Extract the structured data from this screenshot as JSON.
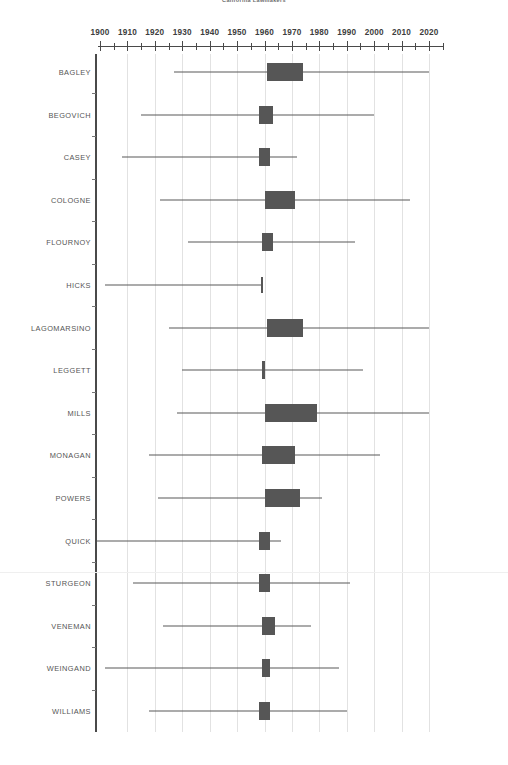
{
  "chart_title": "California Lawmakers",
  "axis": {
    "label": "",
    "tick_labels": [
      "1900",
      "1910",
      "1920",
      "1930",
      "1940",
      "1950",
      "1960",
      "1970",
      "1980",
      "1990",
      "2000",
      "2010",
      "2020"
    ],
    "minor_tick_step": 5,
    "range": [
      1900,
      2025
    ]
  },
  "chart_data": {
    "type": "table",
    "title": "California Lawmakers",
    "xlabel": "Year",
    "ylabel": "",
    "xlim": [
      1900,
      2025
    ],
    "grid": true,
    "legend": "none",
    "categories": [
      "BAGLEY",
      "BEGOVICH",
      "CASEY",
      "COLOGNE",
      "FLOURNOY",
      "HICKS",
      "LAGOMARSINO",
      "LEGGETT",
      "MILLS",
      "MONAGAN",
      "POWERS",
      "QUICK",
      "STURGEON",
      "VENEMAN",
      "WEINGAND",
      "WILLIAMS"
    ],
    "series": [
      {
        "name": "whisker_low",
        "values": [
          1927,
          1915,
          1908,
          1922,
          1932,
          1902,
          1925,
          1930,
          1928,
          1918,
          1921,
          1899,
          1912,
          1923,
          1902,
          1918
        ]
      },
      {
        "name": "box_low",
        "values": [
          1961,
          1958,
          1958,
          1960,
          1959,
          1959,
          1961,
          1959,
          1960,
          1959,
          1960,
          1958,
          1958,
          1959,
          1959,
          1958
        ]
      },
      {
        "name": "box_high",
        "values": [
          1974,
          1963,
          1962,
          1971,
          1963,
          1959,
          1974,
          1960,
          1979,
          1971,
          1973,
          1962,
          1962,
          1964,
          1962,
          1962
        ]
      },
      {
        "name": "whisker_high",
        "values": [
          2020,
          2000,
          1972,
          2013,
          1993,
          1959,
          2020,
          1996,
          2020,
          2002,
          1981,
          1966,
          1991,
          1977,
          1987,
          1990
        ]
      }
    ],
    "rows": [
      {
        "name": "BAGLEY",
        "whisker_low": 1927,
        "box_low": 1961,
        "box_high": 1974,
        "whisker_high": 2020
      },
      {
        "name": "BEGOVICH",
        "whisker_low": 1915,
        "box_low": 1958,
        "box_high": 1963,
        "whisker_high": 2000
      },
      {
        "name": "CASEY",
        "whisker_low": 1908,
        "box_low": 1958,
        "box_high": 1962,
        "whisker_high": 1972
      },
      {
        "name": "COLOGNE",
        "whisker_low": 1922,
        "box_low": 1960,
        "box_high": 1971,
        "whisker_high": 2013
      },
      {
        "name": "FLOURNOY",
        "whisker_low": 1932,
        "box_low": 1959,
        "box_high": 1963,
        "whisker_high": 1993
      },
      {
        "name": "HICKS",
        "whisker_low": 1902,
        "box_low": 1959,
        "box_high": 1959,
        "whisker_high": 1959
      },
      {
        "name": "LAGOMARSINO",
        "whisker_low": 1925,
        "box_low": 1961,
        "box_high": 1974,
        "whisker_high": 2020
      },
      {
        "name": "LEGGETT",
        "whisker_low": 1930,
        "box_low": 1959,
        "box_high": 1960,
        "whisker_high": 1996
      },
      {
        "name": "MILLS",
        "whisker_low": 1928,
        "box_low": 1960,
        "box_high": 1979,
        "whisker_high": 2020
      },
      {
        "name": "MONAGAN",
        "whisker_low": 1918,
        "box_low": 1959,
        "box_high": 1971,
        "whisker_high": 2002
      },
      {
        "name": "POWERS",
        "whisker_low": 1921,
        "box_low": 1960,
        "box_high": 1973,
        "whisker_high": 1981
      },
      {
        "name": "QUICK",
        "whisker_low": 1899,
        "box_low": 1958,
        "box_high": 1962,
        "whisker_high": 1966
      },
      {
        "name": "STURGEON",
        "whisker_low": 1912,
        "box_low": 1958,
        "box_high": 1962,
        "whisker_high": 1991
      },
      {
        "name": "VENEMAN",
        "whisker_low": 1923,
        "box_low": 1959,
        "box_high": 1964,
        "whisker_high": 1977
      },
      {
        "name": "WEINGAND",
        "whisker_low": 1902,
        "box_low": 1959,
        "box_high": 1962,
        "whisker_high": 1987
      },
      {
        "name": "WILLIAMS",
        "whisker_low": 1918,
        "box_low": 1958,
        "box_high": 1962,
        "whisker_high": 1990
      }
    ]
  },
  "colors": {
    "box_fill": "#565656",
    "whisker": "#585858",
    "gridline": "#e2e2e2",
    "axis": "#4a4a4a",
    "label_text": "#555555",
    "tick_text": "#3d3d3d",
    "background": "#ffffff"
  }
}
